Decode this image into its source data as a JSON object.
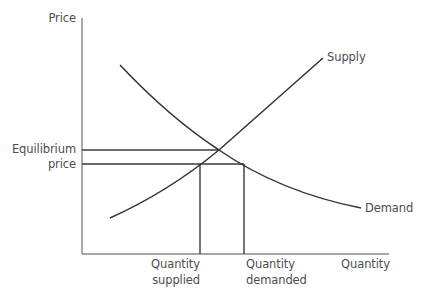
{
  "diagram": {
    "type": "supply-demand",
    "axes": {
      "y_label": "Price",
      "x_label": "Quantity"
    },
    "curves": [
      {
        "name": "Supply",
        "label": "Supply",
        "direction": "upward-sloping"
      },
      {
        "name": "Demand",
        "label": "Demand",
        "direction": "downward-sloping"
      }
    ],
    "price_labels": {
      "line1": "Equilibrium",
      "line2": "price"
    },
    "quantity_labels": {
      "supplied_line1": "Quantity",
      "supplied_line2": "supplied",
      "demanded_line1": "Quantity",
      "demanded_line2": "demanded"
    },
    "colors": {
      "axis": "#8a8a8a",
      "curve": "#333333",
      "text": "#4d4d4d"
    }
  }
}
